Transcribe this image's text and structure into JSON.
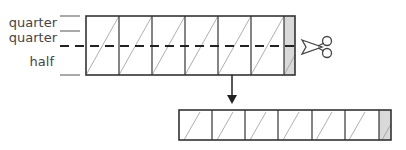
{
  "labels": {
    "quarter_top": "quarter",
    "quarter_bottom": "quarter",
    "half": "half"
  },
  "icons": {
    "cut": "scissors-icon",
    "arrow": "arrow-down-icon"
  },
  "colors": {
    "line": "#333333",
    "tab_fill": "#d9d9d9",
    "diagonal": "#999999"
  },
  "strips": {
    "top": {
      "panels": 6,
      "has_end_tab": true
    },
    "bottom": {
      "panels": 6,
      "has_end_tab": true
    }
  }
}
